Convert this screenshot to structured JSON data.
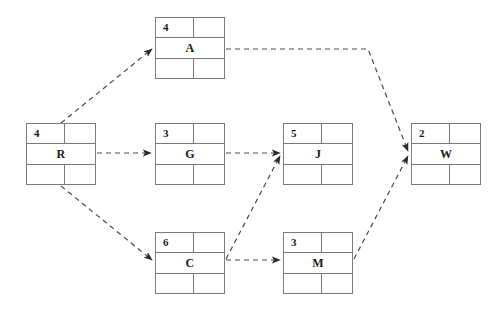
{
  "diagram": {
    "type": "activity-on-node-network",
    "background_color": "#ffffff",
    "node_border_color": "#7a7a7a",
    "edge_color": "#4a4a4a",
    "edge_style": "dashed",
    "text_color": "#1a1a1a"
  },
  "nodes": [
    {
      "id": "R",
      "label": "R",
      "duration": "4",
      "x": 26,
      "y": 123,
      "w": 70,
      "h": 62
    },
    {
      "id": "A",
      "label": "A",
      "duration": "4",
      "x": 155,
      "y": 17,
      "w": 70,
      "h": 62
    },
    {
      "id": "G",
      "label": "G",
      "duration": "3",
      "x": 155,
      "y": 123,
      "w": 70,
      "h": 62
    },
    {
      "id": "C",
      "label": "C",
      "duration": "6",
      "x": 155,
      "y": 232,
      "w": 70,
      "h": 62
    },
    {
      "id": "J",
      "label": "J",
      "duration": "5",
      "x": 283,
      "y": 123,
      "w": 70,
      "h": 62
    },
    {
      "id": "M",
      "label": "M",
      "duration": "3",
      "x": 283,
      "y": 232,
      "w": 70,
      "h": 62
    },
    {
      "id": "W",
      "label": "W",
      "duration": "2",
      "x": 411,
      "y": 123,
      "w": 70,
      "h": 62
    }
  ],
  "edges": [
    {
      "id": "R-A",
      "from": "R",
      "to": "A",
      "points": "61,123 152,49"
    },
    {
      "id": "R-G",
      "from": "R",
      "to": "G",
      "points": "97,153 151,153"
    },
    {
      "id": "R-C",
      "from": "R",
      "to": "C",
      "points": "61,186 152,260"
    },
    {
      "id": "A-W",
      "from": "A",
      "to": "W",
      "points": "226,49 368,49 408,151"
    },
    {
      "id": "G-J",
      "from": "G",
      "to": "J",
      "points": "226,153 280,153"
    },
    {
      "id": "C-J",
      "from": "C",
      "to": "J",
      "points": "226,259 280,156"
    },
    {
      "id": "C-M",
      "from": "C",
      "to": "M",
      "points": "226,260 280,260"
    },
    {
      "id": "M-W",
      "from": "M",
      "to": "W",
      "points": "354,259 408,156"
    }
  ]
}
